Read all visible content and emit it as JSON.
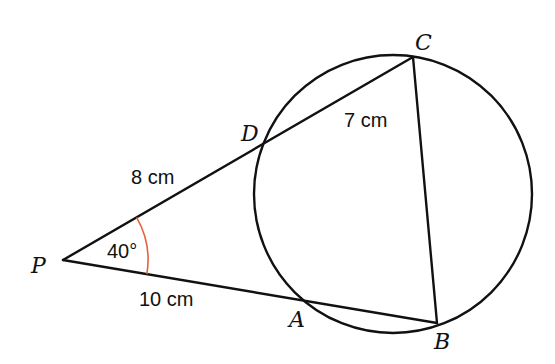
{
  "diagram": {
    "type": "circle-secant-geometry",
    "points": {
      "P": "P",
      "A": "A",
      "B": "B",
      "C": "C",
      "D": "D"
    },
    "lengths": {
      "PD": "8 cm",
      "DC": "7 cm",
      "PA": "10 cm"
    },
    "angle": {
      "vertex": "P",
      "label": "40°",
      "value_degrees": 40
    },
    "segments": [
      "PC",
      "PB",
      "CB"
    ],
    "colors": {
      "lines": "#111111",
      "angle_arc": "#e8603c",
      "background": "#ffffff"
    }
  }
}
